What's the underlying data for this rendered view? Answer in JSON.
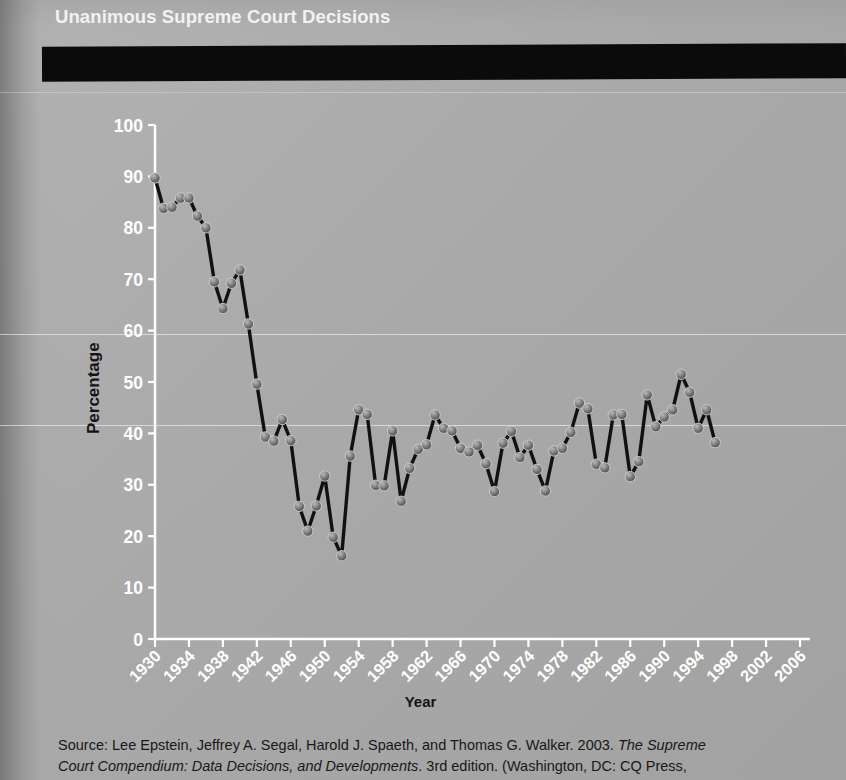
{
  "banner": {
    "title": "Unanimous Supreme Court Decisions"
  },
  "axis": {
    "ylabel": "Percentage",
    "xlabel": "Year",
    "yticks": [
      0,
      10,
      20,
      30,
      40,
      50,
      60,
      70,
      80,
      90,
      100
    ],
    "xticks": [
      1930,
      1934,
      1938,
      1942,
      1946,
      1950,
      1954,
      1958,
      1962,
      1966,
      1970,
      1974,
      1978,
      1982,
      1986,
      1990,
      1994,
      1998,
      2002,
      2006
    ]
  },
  "source": {
    "line1_a": "Source:  Lee Epstein, Jeffrey A. Segal, Harold J. Spaeth, and Thomas G. Walker. 2003. ",
    "line1_b": "The Supreme",
    "line2_a": "Court Compendium: Data Decisions, and Developments",
    "line2_b": ". 3rd edition. (Washington, DC: CQ Press,"
  },
  "colors": {
    "banner_bg": "#0b0b0b",
    "banner_text": "#f2f2f2",
    "page_bg": "#a8a8a8",
    "line": "#111111",
    "marker": "#6e6e6e",
    "axis": "#ffffff",
    "tick_label": "#ffffff",
    "axis_title": "#141414"
  },
  "chart_data": {
    "type": "line",
    "title": "Unanimous Supreme Court Decisions",
    "xlabel": "Year",
    "ylabel": "Percentage",
    "xlim": [
      1930,
      2006
    ],
    "ylim": [
      0,
      100
    ],
    "grid": false,
    "legend": "none",
    "marker": "circle",
    "x": [
      1930,
      1931,
      1932,
      1933,
      1934,
      1935,
      1936,
      1937,
      1938,
      1939,
      1940,
      1941,
      1942,
      1943,
      1944,
      1945,
      1946,
      1947,
      1948,
      1949,
      1950,
      1951,
      1952,
      1953,
      1954,
      1955,
      1956,
      1957,
      1958,
      1959,
      1960,
      1961,
      1962,
      1963,
      1964,
      1965,
      1966,
      1967,
      1968,
      1969,
      1970,
      1971,
      1972,
      1973,
      1974,
      1975,
      1976,
      1977,
      1978,
      1979,
      1980,
      1981,
      1982,
      1983,
      1984,
      1985,
      1986,
      1987,
      1988,
      1989,
      1990,
      1991,
      1992,
      1993,
      1994,
      1995,
      1996,
      1997,
      1998,
      1999,
      2000,
      2001,
      2002,
      2003,
      2004,
      2005,
      2006
    ],
    "y": [
      89.7,
      83.8,
      84.0,
      85.8,
      85.8,
      82.3,
      80.0,
      69.5,
      64.3,
      69.2,
      71.8,
      61.3,
      49.6,
      39.3,
      38.5,
      42.7,
      38.6,
      25.8,
      21.0,
      25.9,
      31.7,
      19.8,
      16.2,
      35.6,
      44.6,
      43.7,
      29.9,
      29.8,
      40.5,
      26.8,
      33.2,
      36.9,
      37.8,
      43.6,
      41.0,
      40.5,
      37.1,
      36.4,
      37.7,
      34.1,
      28.7,
      38.1,
      40.4,
      35.3,
      37.7,
      33.0,
      28.8,
      36.6,
      37.1,
      40.2,
      45.9,
      44.8,
      34.0,
      33.3,
      43.6,
      43.7,
      31.6,
      34.5,
      47.5,
      41.3,
      43.2,
      44.6,
      51.5,
      48.0,
      41.0,
      44.6,
      38.2
    ],
    "series": [
      {
        "name": "Unanimous decisions (%)",
        "points": [
          [
            1930,
            89.7
          ],
          [
            1931,
            83.8
          ],
          [
            1932,
            84.0
          ],
          [
            1933,
            85.8
          ],
          [
            1934,
            85.8
          ],
          [
            1935,
            82.3
          ],
          [
            1936,
            80.0
          ],
          [
            1937,
            69.5
          ],
          [
            1938,
            64.3
          ],
          [
            1939,
            69.2
          ],
          [
            1940,
            71.8
          ],
          [
            1941,
            61.3
          ],
          [
            1942,
            49.6
          ],
          [
            1943,
            39.3
          ],
          [
            1944,
            38.5
          ],
          [
            1945,
            42.7
          ],
          [
            1946,
            38.6
          ],
          [
            1947,
            25.8
          ],
          [
            1948,
            21.0
          ],
          [
            1949,
            25.9
          ],
          [
            1950,
            31.7
          ],
          [
            1951,
            19.8
          ],
          [
            1952,
            16.2
          ],
          [
            1953,
            35.6
          ],
          [
            1954,
            44.6
          ],
          [
            1955,
            43.7
          ],
          [
            1956,
            29.9
          ],
          [
            1957,
            29.8
          ],
          [
            1958,
            40.5
          ],
          [
            1959,
            26.8
          ],
          [
            1960,
            33.2
          ],
          [
            1961,
            36.9
          ],
          [
            1962,
            37.8
          ],
          [
            1963,
            43.6
          ],
          [
            1964,
            41.0
          ],
          [
            1965,
            40.5
          ],
          [
            1966,
            37.1
          ],
          [
            1967,
            36.4
          ],
          [
            1968,
            37.7
          ],
          [
            1969,
            34.1
          ],
          [
            1970,
            28.7
          ],
          [
            1971,
            38.1
          ],
          [
            1972,
            40.4
          ],
          [
            1973,
            35.3
          ],
          [
            1974,
            37.7
          ],
          [
            1975,
            33.0
          ],
          [
            1976,
            28.8
          ],
          [
            1977,
            36.6
          ],
          [
            1978,
            37.1
          ],
          [
            1979,
            40.2
          ],
          [
            1980,
            45.9
          ],
          [
            1981,
            44.8
          ],
          [
            1982,
            34.0
          ],
          [
            1983,
            33.3
          ],
          [
            1984,
            43.6
          ],
          [
            1985,
            43.7
          ],
          [
            1986,
            31.6
          ],
          [
            1987,
            34.5
          ],
          [
            1988,
            47.5
          ],
          [
            1989,
            41.3
          ],
          [
            1990,
            43.2
          ],
          [
            1991,
            44.6
          ],
          [
            1992,
            51.5
          ],
          [
            1993,
            48.0
          ],
          [
            1994,
            41.0
          ],
          [
            1995,
            44.6
          ],
          [
            1996,
            38.2
          ]
        ]
      }
    ]
  }
}
